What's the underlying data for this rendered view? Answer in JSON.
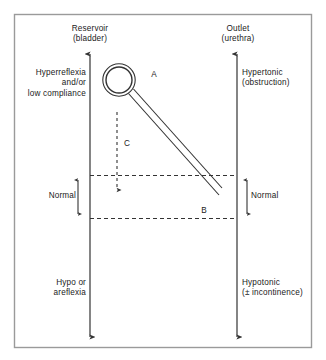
{
  "figure": {
    "border_color": "#999999",
    "line_color": "#333333",
    "text_color": "#1a1a1a"
  },
  "axes": {
    "reservoir": {
      "heading": "Reservoir\n(bladder)",
      "top_label": "Hyperreflexia\nand/or\nlow compliance",
      "normal_label": "Normal",
      "bottom_label": "Hypo or\nareflexia"
    },
    "outlet": {
      "heading": "Outlet\n(urethra)",
      "top_label": "Hypertonic\n(obstruction)",
      "normal_label": "Normal",
      "bottom_label": "Hypotonic\n(± incontinence)"
    }
  },
  "markers": {
    "a": "A",
    "b": "B",
    "c": "C"
  },
  "icons": {
    "balloon": "balloon-catheter-icon",
    "trace": "diagonal-trace-icon",
    "descent": "dashed-descent-arrow-icon",
    "range_left": "double-headed-range-arrow-icon",
    "range_right": "double-headed-range-arrow-icon"
  }
}
